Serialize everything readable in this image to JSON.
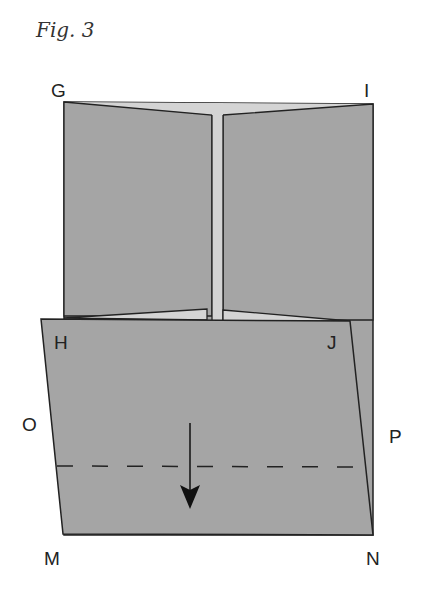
{
  "figure": {
    "caption": "Fig. 3",
    "labels": {
      "G": "G",
      "I": "I",
      "H": "H",
      "J": "J",
      "O": "O",
      "P": "P",
      "M": "M",
      "N": "N"
    },
    "colors": {
      "paper": "#a5a5a5",
      "paper_light": "#d4d4d4",
      "stroke": "#222222",
      "background": "#ffffff"
    },
    "fold_line": "dashed valley fold between O and P",
    "arrow": "fold direction down"
  }
}
